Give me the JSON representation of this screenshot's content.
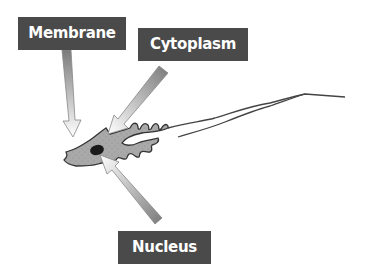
{
  "diagram": {
    "labels": {
      "membrane": "Membrane",
      "cytoplasm": "Cytoplasm",
      "nucleus": "Nucleus"
    },
    "colors": {
      "label_bg": "#4a4a4a",
      "label_text": "#ffffff",
      "cell_fill": "#a8a8a8",
      "nucleus_fill": "#1a1a1a",
      "outline": "#333333",
      "arrow_dark": "#777777",
      "arrow_light": "#ffffff"
    }
  }
}
